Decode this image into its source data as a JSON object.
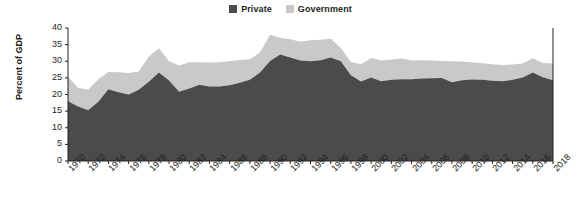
{
  "chart_data": {
    "type": "area",
    "stacked": true,
    "title": "",
    "subtitle": "",
    "xlabel": "",
    "ylabel": "Percent of GDP",
    "ylim": [
      0,
      40
    ],
    "yticks": [
      0,
      5,
      10,
      15,
      20,
      25,
      30,
      35,
      40
    ],
    "grid": false,
    "legend_position": "top-center",
    "x": [
      1970,
      1971,
      1972,
      1973,
      1974,
      1975,
      1976,
      1977,
      1978,
      1979,
      1980,
      1981,
      1982,
      1983,
      1984,
      1985,
      1986,
      1987,
      1988,
      1989,
      1990,
      1991,
      1992,
      1993,
      1994,
      1995,
      1996,
      1997,
      1998,
      1999,
      2000,
      2001,
      2002,
      2003,
      2004,
      2005,
      2006,
      2007,
      2008,
      2009,
      2010,
      2011,
      2012,
      2013,
      2014,
      2015,
      2016,
      2017,
      2018
    ],
    "xtick_labels": [
      "1970",
      "1972",
      "1974",
      "1976",
      "1978",
      "1980",
      "1982",
      "1984",
      "1986",
      "1988",
      "1990",
      "1992",
      "1994",
      "1996",
      "1998",
      "2000",
      "2002",
      "2004",
      "2006",
      "2008",
      "2010",
      "2012",
      "2014",
      "2016",
      "2018"
    ],
    "series": [
      {
        "name": "Private",
        "color": "#4b4b4b",
        "values": [
          18.0,
          16.4,
          15.3,
          17.8,
          21.6,
          20.7,
          20.0,
          21.4,
          23.8,
          26.6,
          24.2,
          20.8,
          21.8,
          22.9,
          22.4,
          22.4,
          22.8,
          23.5,
          24.4,
          26.6,
          30.1,
          32.0,
          31.1,
          30.2,
          30.0,
          30.3,
          31.1,
          30.0,
          25.8,
          23.9,
          25.1,
          24.0,
          24.4,
          24.6,
          24.6,
          24.8,
          24.9,
          25.0,
          23.7,
          24.3,
          24.5,
          24.4,
          24.1,
          24.0,
          24.4,
          25.1,
          26.6,
          25.2,
          24.3
        ]
      },
      {
        "name": "Government",
        "color": "#c9c9c9",
        "values": [
          7.3,
          5.6,
          6.1,
          6.8,
          5.2,
          6.0,
          6.5,
          5.5,
          7.6,
          7.3,
          5.8,
          7.9,
          7.9,
          6.8,
          7.2,
          7.3,
          7.2,
          6.9,
          6.2,
          6.0,
          7.9,
          5.1,
          5.5,
          5.7,
          6.3,
          6.2,
          5.7,
          4.0,
          4.0,
          5.2,
          5.9,
          6.2,
          6.1,
          6.2,
          5.6,
          5.5,
          5.3,
          5.1,
          6.3,
          5.6,
          5.2,
          5.0,
          5.0,
          4.9,
          4.6,
          4.2,
          4.3,
          4.3,
          5.0
        ]
      }
    ]
  },
  "legend": {
    "items": [
      {
        "label": "Private",
        "color": "#4b4b4b"
      },
      {
        "label": "Government",
        "color": "#c9c9c9"
      }
    ]
  },
  "axes": {
    "y_title": "Percent of GDP"
  }
}
